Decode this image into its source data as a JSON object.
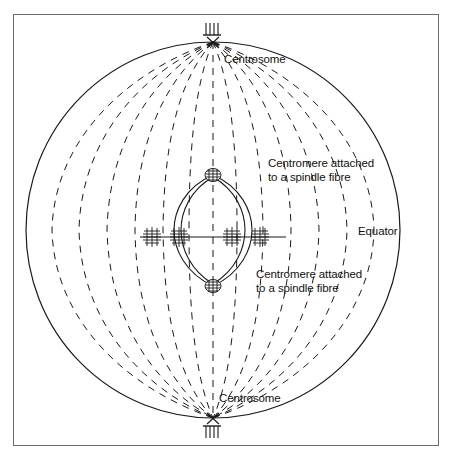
{
  "figure": {
    "type": "biological-diagram",
    "stroke_color": "#1a1a1a",
    "frame_color": "#6b6b6b",
    "background": "#ffffff"
  },
  "labels": {
    "centrosome_top": "Centrosome",
    "centrosome_bottom": "Centrosome",
    "equator": "Equator",
    "centromere_top": "Centromere attached\nto a spindle fibre",
    "centromere_bottom": "Centromere attached\nto a spindle fibre"
  },
  "structures": {
    "cell_outline": "solid ellipse",
    "spindle_fibres": "11 dashed meridian arcs converging at poles",
    "centriole_top": "centriole hatch marks above top pole",
    "centriole_bottom": "centriole hatch marks below bottom pole",
    "spindle_body": "central lens/ellipse spindle",
    "centromere_top": "dark hatched centromere at spindle top",
    "centromere_bottom": "dark hatched centromere at spindle bottom",
    "chromosomes_count": 4,
    "equator_line": "horizontal chromosome plate at equator"
  }
}
